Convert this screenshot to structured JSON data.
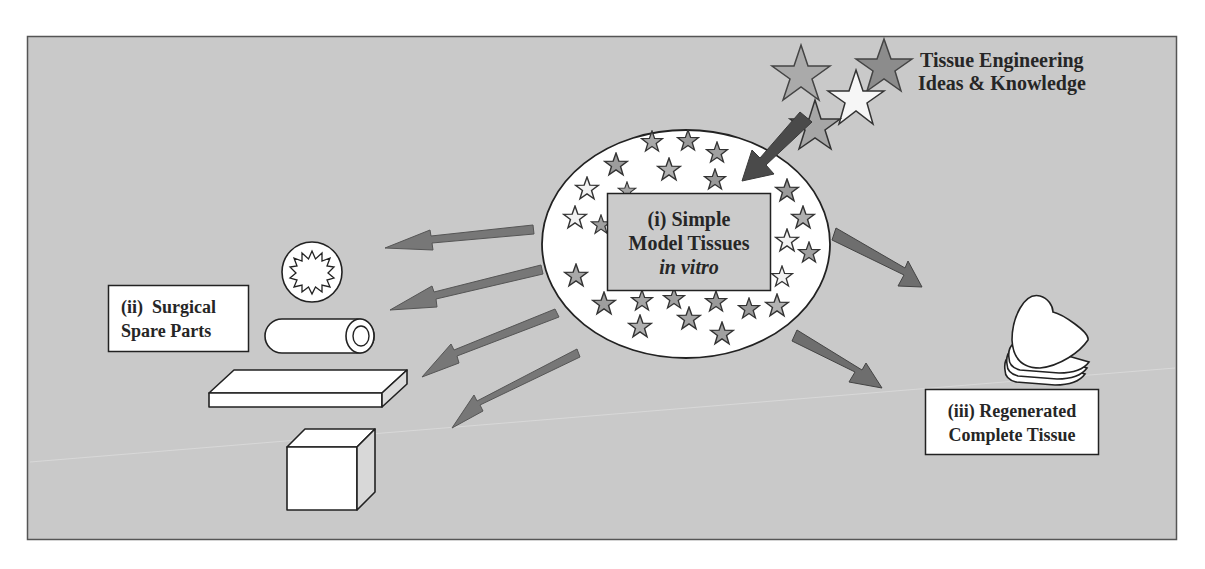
{
  "figure": {
    "background_color": "#c9c9c9",
    "panel_border_color": "#555555",
    "arrow_color": "#767676",
    "inflow_arrow_color": "#4d4d4d",
    "star_colors": {
      "white": "#f4f4f4",
      "light": "#b3b3b3",
      "mid": "#8d8d8d"
    }
  },
  "source": {
    "title_line1": "Tissue Engineering",
    "title_line2": "Ideas & Knowledge"
  },
  "center": {
    "line1": "(i) Simple",
    "line2": "Model Tissues",
    "line3": "in vitro"
  },
  "left": {
    "line1": "(ii)  Surgical",
    "line2": "Spare Parts",
    "shapes": [
      "star-ring",
      "tube",
      "slab",
      "cube"
    ]
  },
  "right": {
    "line1": "(iii) Regenerated",
    "line2": "Complete Tissue",
    "shapes": [
      "stacked-hearts"
    ]
  }
}
